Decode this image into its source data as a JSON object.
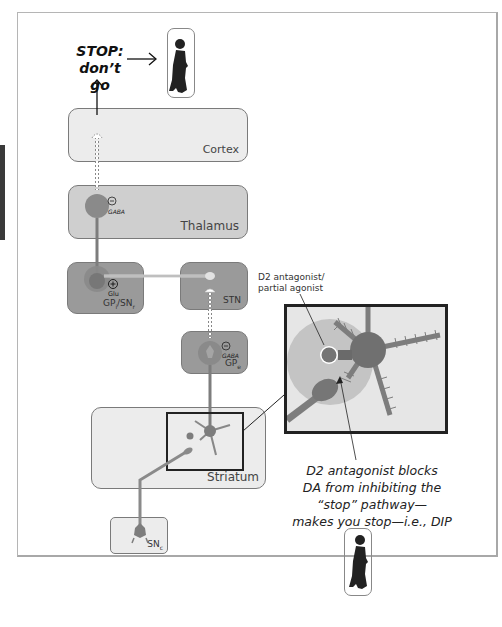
{
  "top": {
    "stop_line1": "STOP:",
    "stop_line2": "don’t go"
  },
  "regions": {
    "cortex": "Cortex",
    "thalamus": "Thalamus",
    "gpi_snr": {
      "main": "GP",
      "sub1": "i",
      "mid": "/SN",
      "sub2": "r"
    },
    "stn": "STN",
    "gpe": {
      "main": "GP",
      "sub": "e"
    },
    "striatum": "Striatum",
    "snc": {
      "main": "SN",
      "sub": "c"
    }
  },
  "synapse_labels": {
    "thalamus_sign": "−",
    "thalamus_nt": "GABA",
    "gpi_sign": "+",
    "gpi_nt": "Glu",
    "gpe_sign": "−",
    "gpe_nt": "GABA"
  },
  "inset": {
    "annotation_line1": "D2 antagonist/",
    "annotation_line2": "partial agonist"
  },
  "caption": {
    "line1": "D2 antagonist blocks",
    "line2": "DA from inhibiting the",
    "line3": "“stop” pathway—",
    "line4": "makes you stop—i.e., DIP"
  },
  "colors": {
    "neuron": "#7d7d7d",
    "neuron_dark": "#6a6a6a",
    "halo": "#bdbdbd",
    "region_light": "#ececec",
    "region_mid": "#cfcfcf",
    "region_dark": "#9a9a9a",
    "border": "#7a7a7a"
  },
  "icons": [
    "person-silhouette-icon",
    "arrow-right-icon",
    "arrow-up-icon"
  ]
}
